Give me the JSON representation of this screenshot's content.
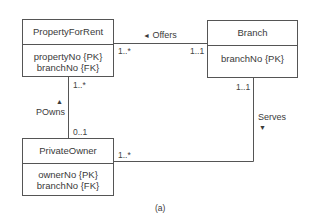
{
  "classes": [
    {
      "id": "property_for_rent",
      "name": "PropertyForRent",
      "attributes": [
        "propertyNo {PK}",
        "branchNo {FK}"
      ]
    },
    {
      "id": "branch",
      "name": "Branch",
      "attributes": [
        "branchNo {PK}"
      ]
    },
    {
      "id": "private_owner",
      "name": "PrivateOwner",
      "attributes": [
        "ownerNo {PK}",
        "branchNo {FK}"
      ]
    }
  ],
  "associations": [
    {
      "name": "Offers",
      "direction_icon": "triangle-left-icon",
      "from": "Branch",
      "to": "PropertyForRent",
      "multiplicity_property": "1..*",
      "multiplicity_branch": "1..1"
    },
    {
      "name": "POwns",
      "direction_icon": "triangle-up-icon",
      "from": "PrivateOwner",
      "to": "PropertyForRent",
      "multiplicity_property": "1..*",
      "multiplicity_owner": "0..1"
    },
    {
      "name": "Serves",
      "direction_icon": "triangle-down-icon",
      "from": "Branch",
      "to": "PrivateOwner",
      "multiplicity_branch": "1..1",
      "multiplicity_owner": "1..*"
    }
  ],
  "glyphs": {
    "left": "◄",
    "up": "▲",
    "down": "▼"
  },
  "caption": "(a)",
  "colors": {
    "line": "#555555",
    "text": "#3a3a3a",
    "background": "#ffffff"
  }
}
